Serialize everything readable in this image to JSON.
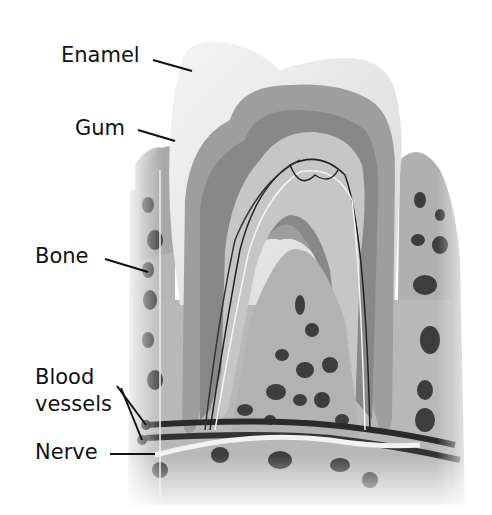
{
  "diagram": {
    "type": "anatomical-cross-section",
    "labels": [
      {
        "id": "enamel",
        "text": "Enamel"
      },
      {
        "id": "gum",
        "text": "Gum"
      },
      {
        "id": "bone",
        "text": "Bone"
      },
      {
        "id": "blood-vessels-1",
        "text": "Blood"
      },
      {
        "id": "blood-vessels-2",
        "text": "vessels"
      },
      {
        "id": "nerve",
        "text": "Nerve"
      }
    ],
    "colors": {
      "background": "#ffffff",
      "text": "#111111",
      "enamel": "#eeeeee",
      "dentin": "#9a9a9a",
      "dentin_inner": "#858585",
      "pulp": "#c8c8c8",
      "bone": "#b5b5b5",
      "bone_holes": "#3a3a3a",
      "gum": "#a8a8a8",
      "vessel": "#2a2a2a",
      "nerve": "#f5f5f5"
    }
  }
}
